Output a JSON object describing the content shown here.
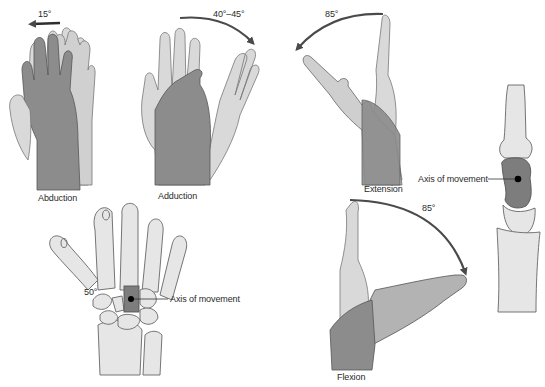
{
  "figure": {
    "panels": [
      {
        "id": "abduction",
        "label": "Abduction",
        "angle": "15°"
      },
      {
        "id": "adduction",
        "label": "Adduction",
        "angle": "40°–45°"
      },
      {
        "id": "extension",
        "label": "Extension",
        "angle": "85°"
      },
      {
        "id": "flexion",
        "label": "Flexion",
        "angle": "85°"
      },
      {
        "id": "carpal-bones",
        "axis_label": "Axis of movement",
        "angle": "50°"
      },
      {
        "id": "lateral-bones",
        "axis_label": "Axis of movement"
      }
    ],
    "colors": {
      "light_hand": "#d9d9d9",
      "dark_hand": "#8c8c8c",
      "mid_hand": "#b3b3b3",
      "outline": "#555555",
      "arrow": "#4a4a4a",
      "bone": "#e6e6e6",
      "axis_bone": "#7d7d7d",
      "axis_dot": "#000000"
    }
  }
}
